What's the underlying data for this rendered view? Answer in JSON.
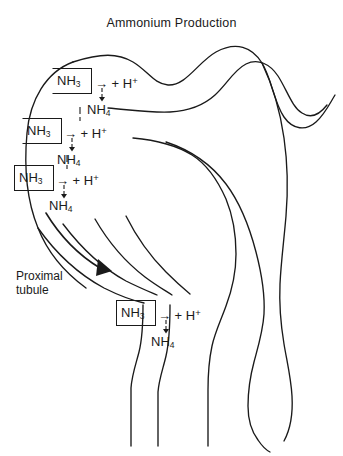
{
  "figure": {
    "title": "Ammonium Production",
    "type": "anatomical-diagram",
    "stroke_color": "#1a1a1a",
    "background_color": "#ffffff"
  },
  "labels": {
    "proximal_tubule": "Proximal\ntubule"
  },
  "reactions": [
    {
      "id": "reaction-1",
      "reactant_boxed": "NH3",
      "reactant_html": "NH<sub>3</sub>",
      "arrow": "→",
      "cotransport": "+ H+",
      "cotransport_html": "+ H<sup>+</sup>",
      "down_arrow": "↓",
      "product": "NH4",
      "product_html": "NH<sub>4</sub>"
    },
    {
      "id": "reaction-2",
      "reactant_boxed": "NH3",
      "reactant_html": "NH<sub>3</sub>",
      "arrow": "→",
      "cotransport": "+ H+",
      "cotransport_html": "+ H<sup>+</sup>",
      "down_arrow": "↓",
      "product": "NH4",
      "product_html": "NH<sub>4</sub>"
    },
    {
      "id": "reaction-3",
      "reactant_boxed": "NH3",
      "reactant_html": "NH<sub>3</sub>",
      "arrow": "→",
      "cotransport": "+ H+",
      "cotransport_html": "+ H<sup>+</sup>",
      "down_arrow": "↓",
      "product": "NH4",
      "product_html": "NH<sub>4</sub>"
    },
    {
      "id": "reaction-4",
      "reactant_boxed": "NH3",
      "reactant_html": "NH<sub>3</sub>",
      "arrow": "→",
      "cotransport": "+ H+",
      "cotransport_html": "+ H<sup>+</sup>",
      "down_arrow": "↓",
      "product": "NH4",
      "product_html": "NH<sub>4</sub>"
    }
  ],
  "flow_arrow": {
    "name": "tubular-flow-arrow",
    "description": "solid triangular arrowhead indicating luminal flow"
  }
}
